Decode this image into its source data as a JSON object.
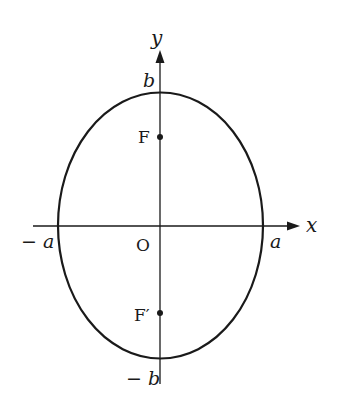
{
  "diagram": {
    "type": "ellipse-on-axes",
    "colors": {
      "stroke": "#1a1a1a",
      "background": "#ffffff"
    },
    "axes": {
      "x_label": "x",
      "y_label": "y",
      "origin_label": "O"
    },
    "vertices": {
      "right": "a",
      "left": "− a",
      "top": "b",
      "bottom": "− b"
    },
    "foci": [
      {
        "label": "F",
        "position": "upper"
      },
      {
        "label": "F′",
        "position": "lower"
      }
    ]
  }
}
